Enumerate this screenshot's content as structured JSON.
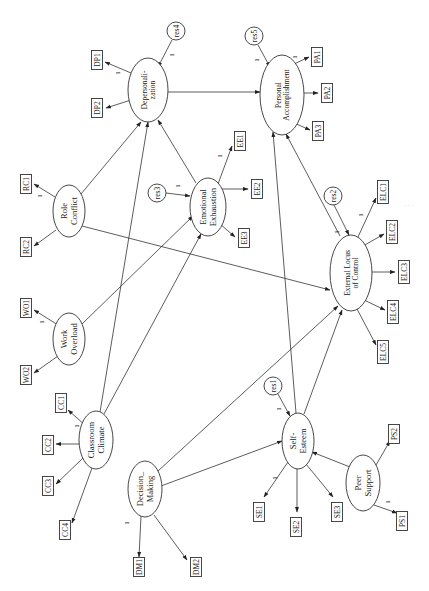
{
  "diagram": {
    "orientation": "rotated-90-ccw",
    "latent_variables": [
      {
        "id": "DP",
        "label_lines": [
          "Depersonali-",
          "zation"
        ],
        "cx": 148,
        "cy": 90,
        "rx": 20,
        "ry": 32
      },
      {
        "id": "PA",
        "label_lines": [
          "Personal",
          "Accomplishment"
        ],
        "cx": 282,
        "cy": 95,
        "rx": 22,
        "ry": 40
      },
      {
        "id": "EE",
        "label_lines": [
          "Emotional",
          "Exhaustion"
        ],
        "cx": 208,
        "cy": 207,
        "rx": 18,
        "ry": 29
      },
      {
        "id": "RC",
        "label_lines": [
          "Role",
          "Conflict"
        ],
        "cx": 69,
        "cy": 211,
        "rx": 16,
        "ry": 26
      },
      {
        "id": "WO",
        "label_lines": [
          "Work",
          "Overload"
        ],
        "cx": 69,
        "cy": 339,
        "rx": 16,
        "ry": 26
      },
      {
        "id": "CC",
        "label_lines": [
          "Classroom",
          "Climate"
        ],
        "cx": 96,
        "cy": 440,
        "rx": 17,
        "ry": 29
      },
      {
        "id": "DM",
        "label_lines": [
          "Decision_",
          "Making"
        ],
        "cx": 145,
        "cy": 489,
        "rx": 17,
        "ry": 28
      },
      {
        "id": "ELC",
        "label_lines": [
          "External Locus",
          "of Control"
        ],
        "cx": 351,
        "cy": 273,
        "rx": 21,
        "ry": 38
      },
      {
        "id": "SE",
        "label_lines": [
          "Self-",
          "Esteem"
        ],
        "cx": 298,
        "cy": 441,
        "rx": 16,
        "ry": 28
      },
      {
        "id": "PS",
        "label_lines": [
          "Peer",
          "Support"
        ],
        "cx": 363,
        "cy": 483,
        "rx": 17,
        "ry": 28
      }
    ],
    "residuals": [
      {
        "id": "res1",
        "label": "res1",
        "cx": 273,
        "cy": 386,
        "r": 9
      },
      {
        "id": "res2",
        "label": "res2",
        "cx": 333,
        "cy": 196,
        "r": 9
      },
      {
        "id": "res3",
        "label": "res3",
        "cx": 157,
        "cy": 193,
        "r": 9
      },
      {
        "id": "res4",
        "label": "res4",
        "cx": 176,
        "cy": 31,
        "r": 9
      },
      {
        "id": "res5",
        "label": "res5",
        "cx": 254,
        "cy": 36,
        "r": 9
      }
    ],
    "indicators": [
      {
        "id": "DP1",
        "label": "DP1",
        "cx": 97,
        "cy": 60
      },
      {
        "id": "DP2",
        "label": "DP2",
        "cx": 97,
        "cy": 108
      },
      {
        "id": "PA1",
        "label": "PA1",
        "cx": 317,
        "cy": 57
      },
      {
        "id": "PA2",
        "label": "PA2",
        "cx": 327,
        "cy": 93
      },
      {
        "id": "PA3",
        "label": "PA3",
        "cx": 318,
        "cy": 131
      },
      {
        "id": "EE1",
        "label": "EE1",
        "cx": 240,
        "cy": 141
      },
      {
        "id": "EE2",
        "label": "EE2",
        "cx": 257,
        "cy": 189
      },
      {
        "id": "EE3",
        "label": "EE3",
        "cx": 244,
        "cy": 238
      },
      {
        "id": "RC1",
        "label": "RC1",
        "cx": 26,
        "cy": 184
      },
      {
        "id": "RC2",
        "label": "RC2",
        "cx": 26,
        "cy": 247
      },
      {
        "id": "WO1",
        "label": "WO1",
        "cx": 26,
        "cy": 308
      },
      {
        "id": "WO2",
        "label": "WO2",
        "cx": 26,
        "cy": 375
      },
      {
        "id": "CC1",
        "label": "CC1",
        "cx": 61,
        "cy": 403
      },
      {
        "id": "CC2",
        "label": "CC2",
        "cx": 48,
        "cy": 445
      },
      {
        "id": "CC3",
        "label": "CC3",
        "cx": 48,
        "cy": 486
      },
      {
        "id": "CC4",
        "label": "CC4",
        "cx": 65,
        "cy": 530
      },
      {
        "id": "DM1",
        "label": "DM1",
        "cx": 139,
        "cy": 567
      },
      {
        "id": "DM2",
        "label": "DM2",
        "cx": 196,
        "cy": 567
      },
      {
        "id": "ELC1",
        "label": "ELC1",
        "cx": 383,
        "cy": 192
      },
      {
        "id": "ELC2",
        "label": "ELC2",
        "cx": 392,
        "cy": 232
      },
      {
        "id": "ELC3",
        "label": "ELC3",
        "cx": 404,
        "cy": 272
      },
      {
        "id": "ELC4",
        "label": "ELC4",
        "cx": 393,
        "cy": 312
      },
      {
        "id": "ELC5",
        "label": "ELC5",
        "cx": 383,
        "cy": 352
      },
      {
        "id": "SE1",
        "label": "SE1",
        "cx": 259,
        "cy": 512
      },
      {
        "id": "SE2",
        "label": "SE2",
        "cx": 296,
        "cy": 527
      },
      {
        "id": "SE3",
        "label": "SE3",
        "cx": 337,
        "cy": 512
      },
      {
        "id": "PS1",
        "label": "PS1",
        "cx": 402,
        "cy": 521
      },
      {
        "id": "PS2",
        "label": "PS2",
        "cx": 394,
        "cy": 434
      }
    ],
    "measurement_paths": [
      {
        "from": "DP",
        "to": "DP1",
        "fixed": "1",
        "x1": 131,
        "y1": 73,
        "x2": 105,
        "y2": 62,
        "lx": 118,
        "ly": 73
      },
      {
        "from": "DP",
        "to": "DP2",
        "fixed": "",
        "x1": 131,
        "y1": 100,
        "x2": 106,
        "y2": 108
      },
      {
        "from": "PA",
        "to": "PA1",
        "fixed": "1",
        "x1": 292,
        "y1": 65,
        "x2": 309,
        "y2": 57,
        "lx": 295,
        "ly": 57
      },
      {
        "from": "PA",
        "to": "PA2",
        "fixed": "",
        "x1": 294,
        "y1": 93,
        "x2": 318,
        "y2": 93
      },
      {
        "from": "PA",
        "to": "PA3",
        "fixed": "",
        "x1": 292,
        "y1": 122,
        "x2": 310,
        "y2": 130
      },
      {
        "from": "EE",
        "to": "EE1",
        "fixed": "1",
        "x1": 218,
        "y1": 184,
        "x2": 232,
        "y2": 146,
        "lx": 220,
        "ly": 156
      },
      {
        "from": "EE",
        "to": "EE2",
        "fixed": "",
        "x1": 222,
        "y1": 189,
        "x2": 248,
        "y2": 189
      },
      {
        "from": "EE",
        "to": "EE3",
        "fixed": "",
        "x1": 219,
        "y1": 223,
        "x2": 235,
        "y2": 237
      },
      {
        "from": "RC",
        "to": "RC1",
        "fixed": "1",
        "x1": 55,
        "y1": 197,
        "x2": 34,
        "y2": 184,
        "lx": 40,
        "ly": 196
      },
      {
        "from": "RC",
        "to": "RC2",
        "fixed": "",
        "x1": 56,
        "y1": 230,
        "x2": 34,
        "y2": 246
      },
      {
        "from": "WO",
        "to": "WO1",
        "fixed": "1",
        "x1": 58,
        "y1": 325,
        "x2": 34,
        "y2": 310,
        "lx": 42,
        "ly": 322
      },
      {
        "from": "WO",
        "to": "WO2",
        "fixed": "",
        "x1": 58,
        "y1": 356,
        "x2": 34,
        "y2": 373
      },
      {
        "from": "CC",
        "to": "CC1",
        "fixed": "1",
        "x1": 86,
        "y1": 426,
        "x2": 68,
        "y2": 410,
        "lx": 77,
        "ly": 426
      },
      {
        "from": "CC",
        "to": "CC2",
        "fixed": "",
        "x1": 81,
        "y1": 444,
        "x2": 56,
        "y2": 444
      },
      {
        "from": "CC",
        "to": "CC3",
        "fixed": "",
        "x1": 83,
        "y1": 458,
        "x2": 56,
        "y2": 484
      },
      {
        "from": "CC",
        "to": "CC4",
        "fixed": "",
        "x1": 92,
        "y1": 468,
        "x2": 72,
        "y2": 523
      },
      {
        "from": "DM",
        "to": "DM1",
        "fixed": "1",
        "x1": 141,
        "y1": 516,
        "x2": 139,
        "y2": 557,
        "lx": 127,
        "ly": 523
      },
      {
        "from": "DM",
        "to": "DM2",
        "fixed": "",
        "x1": 154,
        "y1": 515,
        "x2": 187,
        "y2": 560
      },
      {
        "from": "ELC",
        "to": "ELC1",
        "fixed": "1",
        "x1": 358,
        "y1": 237,
        "x2": 376,
        "y2": 198,
        "lx": 361,
        "ly": 215
      },
      {
        "from": "ELC",
        "to": "ELC2",
        "fixed": "",
        "x1": 363,
        "y1": 246,
        "x2": 384,
        "y2": 234
      },
      {
        "from": "ELC",
        "to": "ELC3",
        "fixed": "",
        "x1": 372,
        "y1": 272,
        "x2": 395,
        "y2": 272
      },
      {
        "from": "ELC",
        "to": "ELC4",
        "fixed": "",
        "x1": 364,
        "y1": 300,
        "x2": 385,
        "y2": 310
      },
      {
        "from": "ELC",
        "to": "ELC5",
        "fixed": "",
        "x1": 357,
        "y1": 309,
        "x2": 376,
        "y2": 345
      },
      {
        "from": "SE",
        "to": "SE1",
        "fixed": "1",
        "x1": 288,
        "y1": 462,
        "x2": 264,
        "y2": 497,
        "lx": 275,
        "ly": 478
      },
      {
        "from": "SE",
        "to": "SE2",
        "fixed": "",
        "x1": 297,
        "y1": 469,
        "x2": 297,
        "y2": 512
      },
      {
        "from": "SE",
        "to": "SE3",
        "fixed": "",
        "x1": 306,
        "y1": 464,
        "x2": 333,
        "y2": 497
      },
      {
        "from": "PS",
        "to": "PS1",
        "fixed": "1",
        "x1": 374,
        "y1": 505,
        "x2": 397,
        "y2": 513,
        "lx": 388,
        "ly": 502
      },
      {
        "from": "PS",
        "to": "PS2",
        "fixed": "",
        "x1": 376,
        "y1": 465,
        "x2": 390,
        "y2": 441
      }
    ],
    "residual_paths": [
      {
        "from": "res4",
        "to": "DP",
        "fixed": "1",
        "x1": 172,
        "y1": 40,
        "x2": 158,
        "y2": 67,
        "lx": 172,
        "ly": 55
      },
      {
        "from": "res5",
        "to": "PA",
        "fixed": "1",
        "x1": 258,
        "y1": 45,
        "x2": 270,
        "y2": 67,
        "lx": 257,
        "ly": 60
      },
      {
        "from": "res3",
        "to": "EE",
        "fixed": "1",
        "x1": 166,
        "y1": 193,
        "x2": 190,
        "y2": 196,
        "lx": 178,
        "ly": 186
      },
      {
        "from": "res2",
        "to": "ELC",
        "fixed": "1",
        "x1": 334,
        "y1": 205,
        "x2": 349,
        "y2": 235,
        "lx": 337,
        "ly": 232
      },
      {
        "from": "res1",
        "to": "SE",
        "fixed": "1",
        "x1": 278,
        "y1": 394,
        "x2": 290,
        "y2": 416,
        "lx": 279,
        "ly": 409
      }
    ],
    "structural_paths": [
      {
        "from": "DP",
        "to": "PA",
        "x1": 168,
        "y1": 92,
        "x2": 260,
        "y2": 92
      },
      {
        "from": "RC",
        "to": "DP",
        "x1": 81,
        "y1": 194,
        "x2": 141,
        "y2": 122
      },
      {
        "from": "RC",
        "to": "ELC",
        "x1": 82,
        "y1": 226,
        "x2": 330,
        "y2": 290
      },
      {
        "from": "WO",
        "to": "EE",
        "x1": 82,
        "y1": 324,
        "x2": 193,
        "y2": 216
      },
      {
        "from": "CC",
        "to": "DP",
        "x1": 100,
        "y1": 412,
        "x2": 148,
        "y2": 122
      },
      {
        "from": "CC",
        "to": "EE",
        "x1": 104,
        "y1": 414,
        "x2": 201,
        "y2": 234
      },
      {
        "from": "EE",
        "to": "DP",
        "x1": 196,
        "y1": 183,
        "x2": 158,
        "y2": 120
      },
      {
        "from": "DM",
        "to": "ELC",
        "x1": 158,
        "y1": 471,
        "x2": 338,
        "y2": 306
      },
      {
        "from": "DM",
        "to": "SE",
        "x1": 161,
        "y1": 486,
        "x2": 282,
        "y2": 441
      },
      {
        "from": "SE",
        "to": "PA",
        "x1": 296,
        "y1": 413,
        "x2": 273,
        "y2": 132
      },
      {
        "from": "SE",
        "to": "ELC",
        "x1": 304,
        "y1": 414,
        "x2": 342,
        "y2": 310
      },
      {
        "from": "ELC",
        "to": "PA",
        "x1": 340,
        "y1": 236,
        "x2": 286,
        "y2": 134
      },
      {
        "from": "PS",
        "to": "SE",
        "x1": 350,
        "y1": 467,
        "x2": 312,
        "y2": 452
      }
    ],
    "edge_artifact_text": "· · ·"
  },
  "colors": {
    "stroke": "#333333",
    "text": "#222222",
    "background": "#ffffff"
  }
}
